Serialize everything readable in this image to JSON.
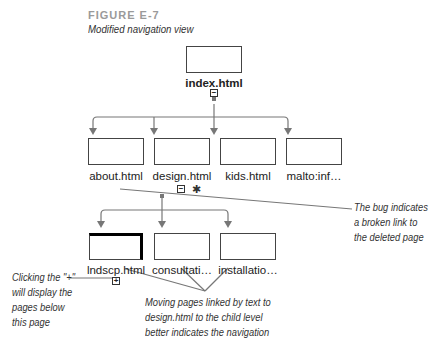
{
  "figure": {
    "label": "FIGURE E-7",
    "caption": "Modified navigation view"
  },
  "tree": {
    "root": {
      "label": "index.html",
      "toggle": "−"
    },
    "level1": [
      {
        "label": "about.html"
      },
      {
        "label": "design.html",
        "toggle": "−",
        "broken_link_icon": "bug-icon"
      },
      {
        "label": "kids.html"
      },
      {
        "label": "malto:inf…"
      }
    ],
    "level2": [
      {
        "label": "lndscp.html",
        "selected": true,
        "toggle": "+"
      },
      {
        "label": "consultati…"
      },
      {
        "label": "installatio…"
      }
    ]
  },
  "callouts": {
    "bug": [
      "The bug indicates",
      "a broken link to",
      "the deleted page"
    ],
    "plus": [
      "Clicking the \"+\"",
      "will display the",
      "pages below",
      "this page"
    ],
    "moving": [
      "Moving pages linked by text to",
      "design.html to the child level",
      "better indicates the navigation"
    ]
  },
  "colors": {
    "line": "#777777",
    "box_border": "#444444",
    "figure_label": "#9a9a9a"
  }
}
